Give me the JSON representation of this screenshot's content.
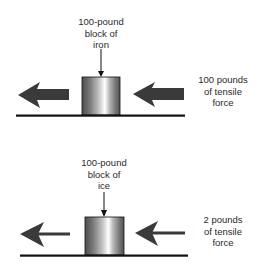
{
  "diagram": {
    "panels": [
      {
        "id": "iron",
        "block_label": [
          "100-pound",
          "block of",
          "iron"
        ],
        "force_label": [
          "100 pounds",
          "of tensile",
          "force"
        ],
        "arrow_style": "thick"
      },
      {
        "id": "ice",
        "block_label": [
          "100-pound",
          "block of",
          "ice"
        ],
        "force_label": [
          "2 pounds",
          "of tensile",
          "force"
        ],
        "arrow_style": "thin"
      }
    ],
    "colors": {
      "arrow": "#3a3a3a",
      "ground": "#111111",
      "block_dark": "#555555",
      "block_light": "#ffffff",
      "text": "#2a2a2a"
    }
  }
}
